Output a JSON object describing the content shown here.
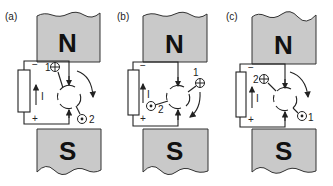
{
  "figure": {
    "colors": {
      "magnet_fill": "#c9c9c9",
      "stroke": "#222222",
      "background": "#ffffff"
    },
    "panels": [
      {
        "label": "(a)",
        "north": "N",
        "south": "S",
        "minus": "−",
        "plus": "+",
        "current": "I",
        "conductor_in_label": "1",
        "conductor_out_label": "2",
        "rotation": "clockwise"
      },
      {
        "label": "(b)",
        "north": "N",
        "south": "S",
        "minus": "−",
        "plus": "+",
        "current": "I",
        "conductor_in_label": "1",
        "conductor_out_label": "2",
        "rotation": "clockwise"
      },
      {
        "label": "(c)",
        "north": "N",
        "south": "S",
        "minus": "−",
        "plus": "+",
        "current": "I",
        "conductor_in_label": "2",
        "conductor_out_label": "1",
        "rotation": "clockwise"
      }
    ],
    "symbols": {
      "into_page": "conductor-cross-icon",
      "out_of_page": "conductor-dot-icon"
    }
  }
}
